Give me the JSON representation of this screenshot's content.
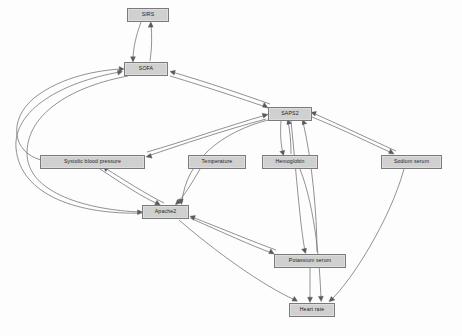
{
  "diagram": {
    "type": "directed-graph",
    "background_color": "#fdfdfd",
    "node_fill_color": "#d0d0d0",
    "node_border_color": "#7a7a7a",
    "edge_color": "#6e6e6e",
    "label_color": "#1c1c1c",
    "nodes": [
      {
        "id": "sirs",
        "label": "SIRS",
        "x": 127,
        "y": 8,
        "w": 42,
        "h": 14
      },
      {
        "id": "sofa",
        "label": "SOFA",
        "x": 124,
        "y": 62,
        "w": 44,
        "h": 14
      },
      {
        "id": "saps2",
        "label": "SAPS2",
        "x": 268,
        "y": 107,
        "w": 44,
        "h": 14
      },
      {
        "id": "systolic_bp",
        "label": "Systolic blood pressure",
        "x": 40,
        "y": 155,
        "w": 105,
        "h": 14
      },
      {
        "id": "temperature",
        "label": "Temperature",
        "x": 188,
        "y": 155,
        "w": 58,
        "h": 14
      },
      {
        "id": "hemoglobin",
        "label": "Hemoglobin",
        "x": 262,
        "y": 155,
        "w": 56,
        "h": 14
      },
      {
        "id": "sodium",
        "label": "Sodium serum",
        "x": 381,
        "y": 155,
        "w": 61,
        "h": 14
      },
      {
        "id": "apache2",
        "label": "Apache2",
        "x": 142,
        "y": 205,
        "w": 47,
        "h": 14
      },
      {
        "id": "potassium",
        "label": "Potassium serum",
        "x": 274,
        "y": 254,
        "w": 72,
        "h": 14
      },
      {
        "id": "heart_rate",
        "label": "Heart rate",
        "x": 289,
        "y": 303,
        "w": 46,
        "h": 14
      }
    ],
    "edges": [
      {
        "from": "sofa",
        "to": "sirs",
        "directed": true
      },
      {
        "from": "sirs",
        "to": "sofa",
        "directed": true
      },
      {
        "from": "saps2",
        "to": "sofa",
        "directed": true
      },
      {
        "from": "sofa",
        "to": "saps2",
        "directed": true
      },
      {
        "from": "systolic_bp",
        "to": "sofa",
        "directed": true
      },
      {
        "from": "apache2",
        "to": "sofa",
        "directed": true
      },
      {
        "from": "saps2",
        "to": "systolic_bp",
        "directed": true
      },
      {
        "from": "systolic_bp",
        "to": "saps2",
        "directed": true
      },
      {
        "from": "saps2",
        "to": "hemoglobin",
        "directed": true
      },
      {
        "from": "hemoglobin",
        "to": "saps2",
        "directed": true
      },
      {
        "from": "saps2",
        "to": "sodium",
        "directed": true
      },
      {
        "from": "sodium",
        "to": "saps2",
        "directed": true
      },
      {
        "from": "saps2",
        "to": "apache2",
        "directed": true
      },
      {
        "from": "saps2",
        "to": "potassium",
        "directed": true
      },
      {
        "from": "potassium",
        "to": "saps2",
        "directed": true
      },
      {
        "from": "temperature",
        "to": "apache2",
        "directed": true
      },
      {
        "from": "systolic_bp",
        "to": "apache2",
        "directed": true
      },
      {
        "from": "apache2",
        "to": "systolic_bp",
        "directed": true
      },
      {
        "from": "apache2",
        "to": "potassium",
        "directed": true
      },
      {
        "from": "potassium",
        "to": "apache2",
        "directed": true
      },
      {
        "from": "apache2",
        "to": "heart_rate",
        "directed": true
      },
      {
        "from": "potassium",
        "to": "heart_rate",
        "directed": true
      },
      {
        "from": "hemoglobin",
        "to": "heart_rate",
        "directed": true
      },
      {
        "from": "sodium",
        "to": "heart_rate",
        "directed": true
      }
    ]
  }
}
